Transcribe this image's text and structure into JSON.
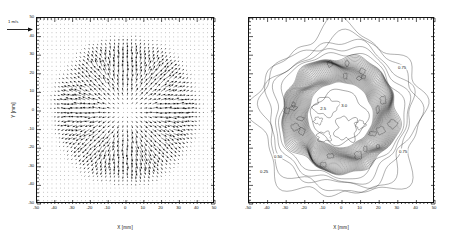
{
  "figure": {
    "panels": [
      {
        "id": "velocity-vector-field",
        "type": "quiver",
        "xlabel": "X  [mm]",
        "ylabel": "Y  [mm]",
        "xticks": [
          "-50",
          "-40",
          "-30",
          "-20",
          "-10",
          "0",
          "10",
          "20",
          "30",
          "40",
          "50"
        ],
        "yticks": [
          "50",
          "40",
          "30",
          "20",
          "10",
          "0",
          "-10",
          "-20",
          "-30",
          "-40",
          "-50"
        ],
        "xlim": [
          -50,
          50
        ],
        "ylim": [
          -50,
          50
        ],
        "scale_annotation": "1 m/s"
      },
      {
        "id": "contour-map",
        "type": "contour",
        "xlabel": "X  [mm]",
        "ylabel": "",
        "xticks": [
          "-50",
          "-40",
          "-30",
          "-20",
          "-10",
          "0",
          "10",
          "20",
          "30",
          "40",
          "50"
        ],
        "yticks": [
          "",
          "",
          "",
          "",
          "",
          "",
          "",
          "",
          "",
          "",
          ""
        ],
        "xlim": [
          -50,
          50
        ],
        "ylim": [
          -50,
          50
        ],
        "contour_labels": [
          "0.25",
          "0.50",
          "0.75",
          "2.5",
          "3.0"
        ]
      }
    ]
  },
  "chart_data": [
    {
      "type": "scatter",
      "title": "",
      "xlabel": "X  [mm]",
      "ylabel": "Y  [mm]",
      "xlim": [
        -50,
        50
      ],
      "ylim": [
        -50,
        50
      ],
      "grid": false,
      "legend": "none",
      "annotations": [
        "1 m/s"
      ],
      "description": "Velocity vector (quiver) field; arrows radiate outward from the centre, magnitudes peak in an annulus of radius ~20-35 mm and fall to near zero at the centre and outside r~40 mm.",
      "vector_field": {
        "grid_spacing_mm": 2.5,
        "reference_vector_m_s": 1.0,
        "radial_profile_mm": [
          0,
          5,
          10,
          15,
          20,
          25,
          30,
          35,
          40,
          45,
          50
        ],
        "radial_speed_m_s": [
          0.05,
          0.35,
          0.75,
          1.1,
          1.35,
          1.4,
          1.25,
          0.85,
          0.35,
          0.1,
          0.03
        ]
      }
    },
    {
      "type": "contour",
      "title": "",
      "xlabel": "X  [mm]",
      "ylabel": "",
      "xlim": [
        -50,
        50
      ],
      "ylim": [
        -50,
        50
      ],
      "grid": false,
      "legend": "none",
      "levels": [
        0.25,
        0.5,
        0.75,
        1.0,
        1.25,
        1.5,
        1.75,
        2.0,
        2.25,
        2.5,
        2.75,
        3.0
      ],
      "labeled_levels": [
        "0.25",
        "0.50",
        "0.75",
        "2.5",
        "3.0"
      ],
      "description": "Concentric closed contours centred near the origin; level value increases inward, densely packed ring between r~18 mm and r~30 mm, irregular low-value contours out to r~45 mm.",
      "radial_profile_mm": [
        0,
        5,
        10,
        15,
        20,
        25,
        30,
        35,
        40,
        45,
        50
      ],
      "radial_value": [
        3.0,
        2.9,
        2.7,
        2.4,
        2.0,
        1.4,
        0.85,
        0.5,
        0.3,
        0.2,
        0.1
      ]
    }
  ]
}
